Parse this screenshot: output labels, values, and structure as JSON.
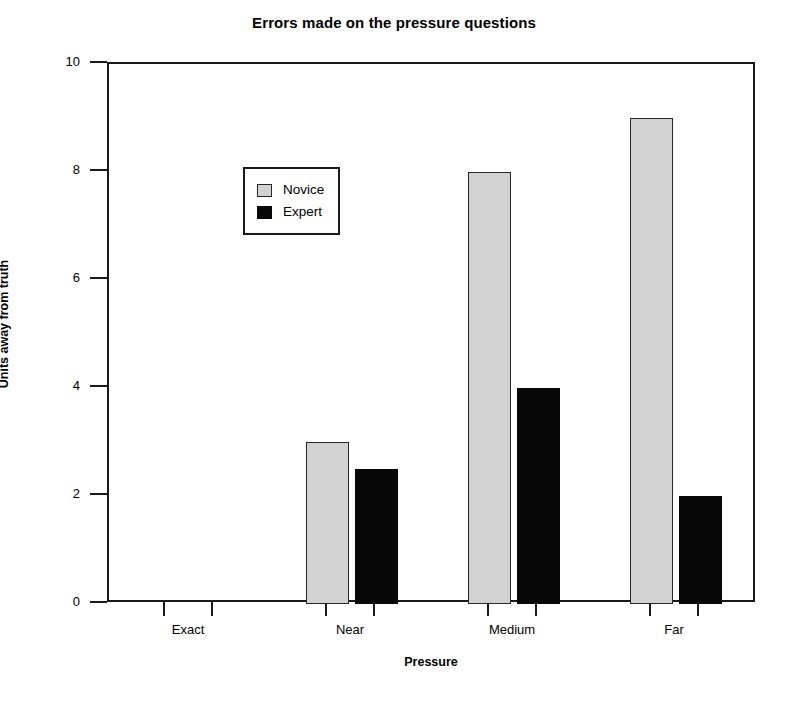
{
  "chart_data": {
    "type": "bar",
    "title": "Errors made on the pressure questions",
    "xlabel": "Pressure",
    "ylabel": "Units away from truth",
    "categories": [
      "Exact",
      "Near",
      "Medium",
      "Far"
    ],
    "series": [
      {
        "name": "Novice",
        "color": "#d2d2d2",
        "values": [
          0,
          3,
          8,
          9
        ]
      },
      {
        "name": "Expert",
        "color": "#070707",
        "values": [
          0,
          2.5,
          4,
          2
        ]
      }
    ],
    "ylim": [
      0,
      10
    ],
    "yticks": [
      0,
      2,
      4,
      6,
      8,
      10
    ],
    "ytick_labels": [
      "0",
      "2",
      "4",
      "6",
      "8",
      "10"
    ],
    "grid": false,
    "legend_position": "upper-left-inside",
    "legend_entries": [
      "Novice",
      "Expert"
    ]
  }
}
